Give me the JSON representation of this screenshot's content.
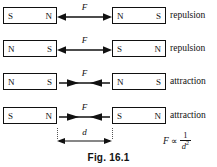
{
  "figure": {
    "caption": "Fig. 16.1",
    "rows": [
      {
        "left_magnet": {
          "left_pole": "S",
          "right_pole": "N"
        },
        "right_magnet": {
          "left_pole": "N",
          "right_pole": "S"
        },
        "force_label": "F",
        "arrow_direction": "outward",
        "effect": "repulsion"
      },
      {
        "left_magnet": {
          "left_pole": "N",
          "right_pole": "S"
        },
        "right_magnet": {
          "left_pole": "S",
          "right_pole": "N"
        },
        "force_label": "F",
        "arrow_direction": "outward",
        "effect": "repulsion"
      },
      {
        "left_magnet": {
          "left_pole": "N",
          "right_pole": "S"
        },
        "right_magnet": {
          "left_pole": "N",
          "right_pole": "S"
        },
        "force_label": "F",
        "arrow_direction": "inward",
        "effect": "attraction"
      },
      {
        "left_magnet": {
          "left_pole": "S",
          "right_pole": "N"
        },
        "right_magnet": {
          "left_pole": "S",
          "right_pole": "N"
        },
        "force_label": "F",
        "arrow_direction": "inward",
        "effect": "attraction"
      }
    ],
    "dimension": {
      "label": "d"
    },
    "formula": {
      "quantity": "F",
      "relation": "∝",
      "numerator": "1",
      "denominator": "d",
      "exponent": "2"
    },
    "colors": {
      "ink": "#111111",
      "paper": "#ffffff",
      "guide": "#555555"
    }
  }
}
